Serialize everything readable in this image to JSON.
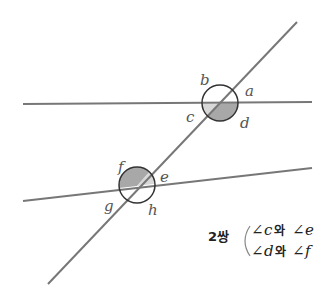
{
  "diagram": {
    "colors": {
      "line": "#777777",
      "circle": "#333333",
      "shade_dark": "#a8a8a8",
      "shade_light": "#d8d8d8"
    },
    "upper_labels": {
      "a": "a",
      "b": "b",
      "c": "c",
      "d": "d"
    },
    "lower_labels": {
      "e": "e",
      "f": "f",
      "g": "g",
      "h": "h"
    },
    "caption": {
      "count": "2쌍",
      "pair1_left": "c",
      "pair1_join": "와",
      "pair1_right": "e",
      "pair2_left": "d",
      "pair2_join": "와",
      "pair2_right": "f",
      "angle_symbol": "∠"
    }
  }
}
